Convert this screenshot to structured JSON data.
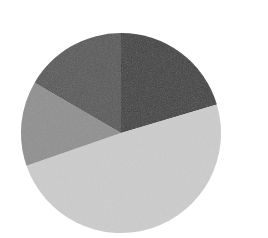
{
  "chart_data": {
    "type": "pie",
    "title": "",
    "xlabel": "",
    "ylabel": "",
    "legend": [],
    "start_angle_deg": 0,
    "direction": "clockwise",
    "center": [
      121,
      133
    ],
    "radius": 100,
    "categories": [
      "Slice 1",
      "Slice 2",
      "Slice 3",
      "Slice 4"
    ],
    "values": [
      20.4,
      49.3,
      13.7,
      16.6
    ],
    "colors": [
      "#3e3e3e",
      "#cdcdcd",
      "#8f8f8f",
      "#565656"
    ],
    "labels_visible": false,
    "grid": false
  }
}
